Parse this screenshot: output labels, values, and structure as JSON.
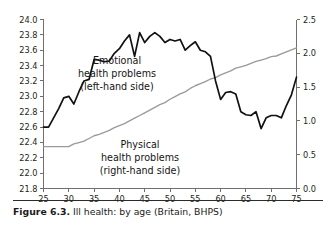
{
  "figure": {
    "caption_label": "Figure 6.3.",
    "caption_text": "Ill health: by age (Britain, BHPS)"
  },
  "annotations": {
    "emotional": {
      "line1": "Emotional",
      "line2": "health problems",
      "line3": "(left-hand side)"
    },
    "physical": {
      "line1": "Physical",
      "line2": "health problems",
      "line3": "(right-hand side)"
    }
  },
  "colors": {
    "emotional_line": "#111111",
    "physical_line": "#9a9a9a",
    "axis": "#6f6f6f",
    "text": "#1a1a1a"
  },
  "chart_data": {
    "type": "line",
    "title": "",
    "subtitle": "",
    "xlabel": "",
    "ylabel": "",
    "grid": false,
    "legend_position": "inline-annotation",
    "xlim": [
      25,
      75
    ],
    "xticks": [
      25,
      30,
      35,
      40,
      45,
      50,
      55,
      60,
      65,
      70,
      75
    ],
    "xtick_labels": [
      "25",
      "30",
      "35",
      "40",
      "45",
      "50",
      "55",
      "60",
      "65",
      "70",
      "75"
    ],
    "y_left": {
      "label": "",
      "lim": [
        21.8,
        24.0
      ],
      "ticks": [
        21.8,
        22.0,
        22.2,
        22.4,
        22.6,
        22.8,
        23.0,
        23.2,
        23.4,
        23.6,
        23.8,
        24.0
      ],
      "tick_labels": [
        "21.8",
        "22.0",
        "22.2",
        "22.4",
        "22.6",
        "22.8",
        "23.0",
        "23.2",
        "23.4",
        "23.6",
        "23.8",
        "24.0"
      ]
    },
    "y_right": {
      "label": "",
      "lim": [
        0.0,
        2.5
      ],
      "ticks": [
        0.0,
        0.5,
        1.0,
        1.5,
        2.0,
        2.5
      ],
      "tick_labels": [
        "0.0",
        "0.5",
        "1.0",
        "1.5",
        "2.0",
        "2.5"
      ]
    },
    "x": [
      25,
      26,
      27,
      28,
      29,
      30,
      31,
      32,
      33,
      34,
      35,
      36,
      37,
      38,
      39,
      40,
      41,
      42,
      43,
      44,
      45,
      46,
      47,
      48,
      49,
      50,
      51,
      52,
      53,
      54,
      55,
      56,
      57,
      58,
      59,
      60,
      61,
      62,
      63,
      64,
      65,
      66,
      67,
      68,
      69,
      70,
      71,
      72,
      73,
      74,
      75
    ],
    "series": [
      {
        "name": "Emotional health problems (left-hand side)",
        "axis": "left",
        "color": "#111111",
        "values": [
          22.6,
          22.6,
          22.72,
          22.84,
          22.98,
          23.0,
          22.9,
          23.06,
          23.2,
          23.22,
          23.48,
          23.47,
          23.45,
          23.46,
          23.56,
          23.62,
          23.72,
          23.8,
          23.52,
          23.83,
          23.7,
          23.78,
          23.83,
          23.78,
          23.7,
          23.74,
          23.72,
          23.74,
          23.6,
          23.66,
          23.71,
          23.6,
          23.58,
          23.52,
          23.2,
          22.96,
          23.05,
          23.06,
          23.03,
          22.8,
          22.76,
          22.75,
          22.8,
          22.58,
          22.72,
          22.75,
          22.75,
          22.72,
          22.88,
          23.02,
          23.25
        ]
      },
      {
        "name": "Physical health problems (right-hand side)",
        "axis": "right",
        "color": "#9a9a9a",
        "values": [
          0.62,
          0.62,
          0.62,
          0.62,
          0.62,
          0.62,
          0.66,
          0.68,
          0.7,
          0.74,
          0.78,
          0.8,
          0.83,
          0.86,
          0.9,
          0.93,
          0.96,
          1.0,
          1.04,
          1.08,
          1.12,
          1.16,
          1.2,
          1.24,
          1.27,
          1.32,
          1.36,
          1.4,
          1.43,
          1.48,
          1.52,
          1.55,
          1.58,
          1.62,
          1.64,
          1.68,
          1.71,
          1.74,
          1.78,
          1.8,
          1.82,
          1.85,
          1.88,
          1.9,
          1.92,
          1.95,
          1.96,
          1.99,
          2.02,
          2.05,
          2.08
        ]
      }
    ]
  }
}
